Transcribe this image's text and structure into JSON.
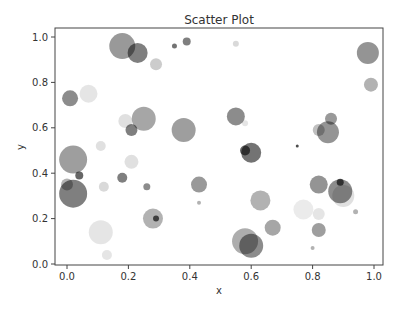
{
  "chart_data": {
    "type": "scatter",
    "title": "Scatter Plot",
    "xlabel": "x",
    "ylabel": "y",
    "xlim": [
      -0.04,
      1.03
    ],
    "ylim": [
      0.0,
      1.04
    ],
    "xticks": [
      0.0,
      0.2,
      0.4,
      0.6,
      0.8,
      1.0
    ],
    "yticks": [
      0.0,
      0.2,
      0.4,
      0.6,
      0.8,
      1.0
    ],
    "xtick_labels": [
      "0.0",
      "0.2",
      "0.4",
      "0.6",
      "0.8",
      "1.0"
    ],
    "ytick_labels": [
      "0.0",
      "0.2",
      "0.4",
      "0.6",
      "0.8",
      "1.0"
    ],
    "grid": false,
    "legend": null,
    "marker_color": "#000000",
    "points": [
      {
        "x": 0.18,
        "y": 0.96,
        "r": 13,
        "a": 0.4
      },
      {
        "x": 0.23,
        "y": 0.93,
        "r": 10,
        "a": 0.5
      },
      {
        "x": 0.29,
        "y": 0.88,
        "r": 6,
        "a": 0.2
      },
      {
        "x": 0.35,
        "y": 0.96,
        "r": 2.5,
        "a": 0.55
      },
      {
        "x": 0.39,
        "y": 0.98,
        "r": 4,
        "a": 0.5
      },
      {
        "x": 0.55,
        "y": 0.97,
        "r": 3,
        "a": 0.15
      },
      {
        "x": 0.98,
        "y": 0.93,
        "r": 11,
        "a": 0.42
      },
      {
        "x": 0.99,
        "y": 0.79,
        "r": 7,
        "a": 0.3
      },
      {
        "x": 0.01,
        "y": 0.73,
        "r": 8,
        "a": 0.45
      },
      {
        "x": 0.07,
        "y": 0.75,
        "r": 9,
        "a": 0.1
      },
      {
        "x": 0.25,
        "y": 0.64,
        "r": 12,
        "a": 0.35
      },
      {
        "x": 0.19,
        "y": 0.63,
        "r": 7,
        "a": 0.12
      },
      {
        "x": 0.21,
        "y": 0.59,
        "r": 6,
        "a": 0.5
      },
      {
        "x": 0.38,
        "y": 0.59,
        "r": 12,
        "a": 0.38
      },
      {
        "x": 0.55,
        "y": 0.65,
        "r": 9,
        "a": 0.45
      },
      {
        "x": 0.58,
        "y": 0.62,
        "r": 3,
        "a": 0.1
      },
      {
        "x": 0.6,
        "y": 0.49,
        "r": 10,
        "a": 0.55
      },
      {
        "x": 0.58,
        "y": 0.5,
        "r": 5,
        "a": 0.6
      },
      {
        "x": 0.86,
        "y": 0.64,
        "r": 6,
        "a": 0.4
      },
      {
        "x": 0.85,
        "y": 0.58,
        "r": 11,
        "a": 0.42
      },
      {
        "x": 0.82,
        "y": 0.59,
        "r": 6,
        "a": 0.25
      },
      {
        "x": 0.75,
        "y": 0.52,
        "r": 1.5,
        "a": 0.7
      },
      {
        "x": 0.11,
        "y": 0.52,
        "r": 5,
        "a": 0.12
      },
      {
        "x": 0.02,
        "y": 0.46,
        "r": 14,
        "a": 0.38
      },
      {
        "x": 0.21,
        "y": 0.45,
        "r": 7,
        "a": 0.12
      },
      {
        "x": 0.04,
        "y": 0.39,
        "r": 4,
        "a": 0.6
      },
      {
        "x": 0.18,
        "y": 0.38,
        "r": 5,
        "a": 0.5
      },
      {
        "x": 0.02,
        "y": 0.31,
        "r": 14,
        "a": 0.5
      },
      {
        "x": 0.0,
        "y": 0.35,
        "r": 6,
        "a": 0.3
      },
      {
        "x": 0.12,
        "y": 0.34,
        "r": 5,
        "a": 0.15
      },
      {
        "x": 0.26,
        "y": 0.34,
        "r": 3.5,
        "a": 0.45
      },
      {
        "x": 0.43,
        "y": 0.35,
        "r": 8,
        "a": 0.4
      },
      {
        "x": 0.43,
        "y": 0.27,
        "r": 2,
        "a": 0.3
      },
      {
        "x": 0.28,
        "y": 0.2,
        "r": 10,
        "a": 0.3
      },
      {
        "x": 0.29,
        "y": 0.2,
        "r": 3,
        "a": 0.65
      },
      {
        "x": 0.11,
        "y": 0.14,
        "r": 12,
        "a": 0.1
      },
      {
        "x": 0.13,
        "y": 0.04,
        "r": 5,
        "a": 0.1
      },
      {
        "x": 0.63,
        "y": 0.28,
        "r": 10,
        "a": 0.3
      },
      {
        "x": 0.58,
        "y": 0.1,
        "r": 13,
        "a": 0.32
      },
      {
        "x": 0.6,
        "y": 0.08,
        "r": 12,
        "a": 0.45
      },
      {
        "x": 0.67,
        "y": 0.16,
        "r": 8,
        "a": 0.35
      },
      {
        "x": 0.82,
        "y": 0.35,
        "r": 9,
        "a": 0.42
      },
      {
        "x": 0.89,
        "y": 0.32,
        "r": 12,
        "a": 0.45
      },
      {
        "x": 0.9,
        "y": 0.3,
        "r": 11,
        "a": 0.12
      },
      {
        "x": 0.89,
        "y": 0.36,
        "r": 3.5,
        "a": 0.65
      },
      {
        "x": 0.77,
        "y": 0.24,
        "r": 10,
        "a": 0.08
      },
      {
        "x": 0.82,
        "y": 0.22,
        "r": 6,
        "a": 0.1
      },
      {
        "x": 0.82,
        "y": 0.15,
        "r": 7,
        "a": 0.38
      },
      {
        "x": 0.94,
        "y": 0.23,
        "r": 2.5,
        "a": 0.3
      },
      {
        "x": 0.8,
        "y": 0.07,
        "r": 2,
        "a": 0.3
      }
    ]
  }
}
